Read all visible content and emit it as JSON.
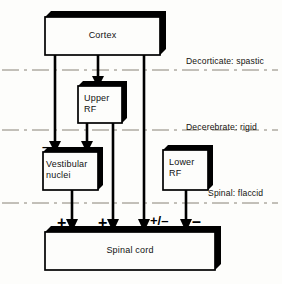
{
  "figure": {
    "background_color": "#fdfdfb",
    "ink_color": "#000000"
  },
  "boxes": [
    {
      "id": "cortex",
      "label": "Cortex",
      "x": 45,
      "y": 17,
      "w": 115,
      "h": 38
    },
    {
      "id": "upper_rf",
      "label": "Upper\nRF",
      "x": 78,
      "y": 86,
      "w": 44,
      "h": 37
    },
    {
      "id": "vestibular",
      "label": "Vestibular\nnuclei",
      "x": 43,
      "y": 152,
      "w": 55,
      "h": 38
    },
    {
      "id": "lower_rf",
      "label": "Lower\nRF",
      "x": 163,
      "y": 150,
      "w": 45,
      "h": 40
    },
    {
      "id": "spinal",
      "label": "Spinal cord",
      "x": 45,
      "y": 232,
      "w": 170,
      "h": 38
    }
  ],
  "level_lines": [
    {
      "id": "decorticate",
      "label": "Decorticate: spastic",
      "y": 70,
      "label_x": 186,
      "label_y": 56
    },
    {
      "id": "decerebrate",
      "label": "Decerebrate: rigid",
      "y": 130,
      "label_x": 186,
      "label_y": 122
    },
    {
      "id": "spinal_level",
      "label": "Spinal: flaccid",
      "y": 203,
      "label_x": 208,
      "label_y": 188
    }
  ],
  "signs": [
    {
      "id": "sign-upper-rf-inhib",
      "text": "–",
      "x": 86,
      "y": 75,
      "size": "minus-sm"
    },
    {
      "id": "sign-vest-left",
      "text": "–",
      "x": 42,
      "y": 140,
      "size": "minus-sm"
    },
    {
      "id": "sign-vest-right",
      "text": "–",
      "x": 93,
      "y": 140,
      "size": "minus-sm"
    },
    {
      "id": "sign-spinal-1-plus",
      "text": "+",
      "x": 57,
      "y": 215,
      "size": "plus-lg"
    },
    {
      "id": "sign-spinal-2-plus",
      "text": "+",
      "x": 98,
      "y": 215,
      "size": "plus-lg"
    },
    {
      "id": "sign-spinal-3-pm",
      "text": "+/–",
      "x": 150,
      "y": 214,
      "size": "plusminus"
    },
    {
      "id": "sign-spinal-4-minus",
      "text": "–",
      "x": 192,
      "y": 214,
      "size": "minus-lg"
    }
  ],
  "connections": [
    {
      "id": "cortex-to-vestibular-left",
      "from": "cortex",
      "to": "vestibular",
      "x": 55,
      "polarity": "–"
    },
    {
      "id": "cortex-to-upper-rf",
      "from": "cortex",
      "to": "upper_rf",
      "x": 98,
      "polarity": "–"
    },
    {
      "id": "cortex-to-spinal-direct",
      "from": "cortex",
      "to": "spinal",
      "x": 144,
      "polarity": "+/–"
    },
    {
      "id": "upper-rf-to-vestibular",
      "from": "upper_rf",
      "to": "vestibular",
      "x": 87,
      "polarity": "–"
    },
    {
      "id": "upper-rf-to-spinal",
      "from": "upper_rf",
      "to": "spinal",
      "x": 113,
      "polarity": "+"
    },
    {
      "id": "vestibular-to-spinal",
      "from": "vestibular",
      "to": "spinal",
      "x": 72,
      "polarity": "+"
    },
    {
      "id": "lower-rf-to-spinal",
      "from": "lower_rf",
      "to": "spinal",
      "x": 186,
      "polarity": "–"
    }
  ]
}
